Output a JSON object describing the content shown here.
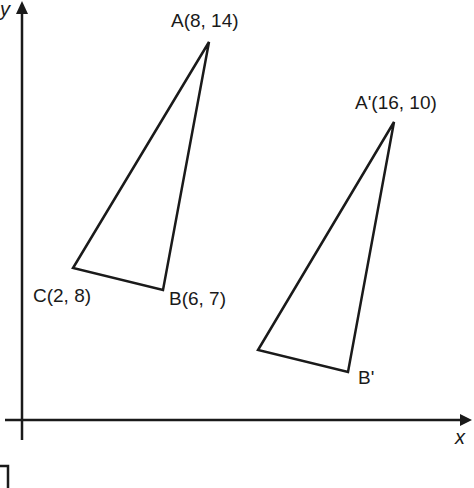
{
  "diagram": {
    "type": "coordinate-plane-translation",
    "axes": {
      "x_label": "x",
      "y_label": "y"
    },
    "original_triangle": {
      "vertices": [
        {
          "name": "A",
          "label": "A(8, 14)",
          "x": 8,
          "y": 14
        },
        {
          "name": "B",
          "label": "B(6, 7)",
          "x": 6,
          "y": 7
        },
        {
          "name": "C",
          "label": "C(2, 8)",
          "x": 2,
          "y": 8
        }
      ]
    },
    "image_triangle": {
      "vertices": [
        {
          "name": "A'",
          "label": "A'(16, 10)",
          "x": 16,
          "y": 10
        },
        {
          "name": "B'",
          "label": "B'"
        },
        {
          "name": "C'",
          "label": ""
        }
      ]
    },
    "colors": {
      "stroke": "#1a1a1a",
      "background": "#ffffff"
    }
  }
}
